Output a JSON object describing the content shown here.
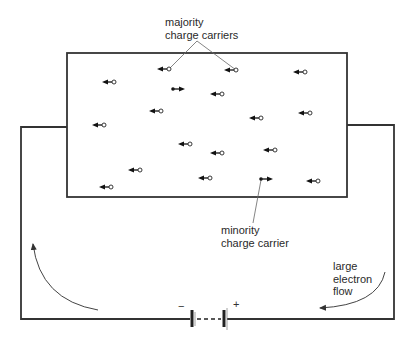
{
  "diagram": {
    "labels": {
      "majority_line1": "majority",
      "majority_line2": "charge carriers",
      "minority_line1": "minority",
      "minority_line2": "charge carrier",
      "flow_line1": "large",
      "flow_line2": "electron",
      "flow_line3": "flow"
    },
    "battery": {
      "negative_sign": "−",
      "positive_sign": "+"
    },
    "colors": {
      "line": "#333333",
      "thin_line": "#555555",
      "text": "#2a2a2a",
      "background": "#ffffff"
    },
    "majority_carriers": [
      {
        "x": 169,
        "y": 69
      },
      {
        "x": 236,
        "y": 70
      },
      {
        "x": 305,
        "y": 72
      },
      {
        "x": 114,
        "y": 82
      },
      {
        "x": 222,
        "y": 94
      },
      {
        "x": 161,
        "y": 111
      },
      {
        "x": 310,
        "y": 113
      },
      {
        "x": 261,
        "y": 118
      },
      {
        "x": 104,
        "y": 125
      },
      {
        "x": 222,
        "y": 153
      },
      {
        "x": 190,
        "y": 144
      },
      {
        "x": 275,
        "y": 150
      },
      {
        "x": 140,
        "y": 170
      },
      {
        "x": 210,
        "y": 178
      },
      {
        "x": 111,
        "y": 187
      },
      {
        "x": 318,
        "y": 181
      }
    ],
    "minority_carriers": [
      {
        "x": 173,
        "y": 89
      },
      {
        "x": 261,
        "y": 179
      }
    ]
  }
}
